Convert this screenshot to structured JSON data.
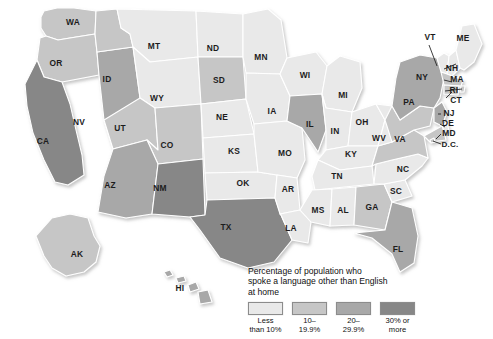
{
  "map": {
    "title": "Percentage of population who spoke a language other than English at home",
    "background_color": "#ffffff",
    "border_color": "#ffffff",
    "label_color": "#1c1c1c"
  },
  "legend": {
    "heading_line1": "Percentage of population who",
    "heading_line2": "spoke a language other than English",
    "heading_line3": "at home",
    "heading": "Percentage of population who\nspoke a language other than English\nat home",
    "items": [
      {
        "label": "Less\nthan 10%",
        "label_line1": "Less",
        "label_line2": "than 10%",
        "color": "#e9e9e9",
        "range_min": 0,
        "range_max": 10
      },
      {
        "label": "10–\n19.9%",
        "label_line1": "10–",
        "label_line2": "19.9%",
        "color": "#c6c6c6",
        "range_min": 10,
        "range_max": 19.9
      },
      {
        "label": "20–\n29.9%",
        "label_line1": "20–",
        "label_line2": "29.9%",
        "color": "#a8a8a8",
        "range_min": 20,
        "range_max": 29.9
      },
      {
        "label": "30% or\nmore",
        "label_line1": "30% or",
        "label_line2": "more",
        "color": "#878787",
        "range_min": 30,
        "range_max": 100
      }
    ]
  },
  "chart_data": {
    "type": "choropleth-map",
    "title": "Percentage of population who spoke a language other than English at home",
    "value_unit": "percent",
    "bins": [
      "Less than 10%",
      "10–19.9%",
      "20–29.9%",
      "30% or more"
    ],
    "bin_colors": [
      "#e9e9e9",
      "#c6c6c6",
      "#a8a8a8",
      "#878787"
    ],
    "categories": [
      "WA",
      "OR",
      "CA",
      "NV",
      "ID",
      "MT",
      "WY",
      "UT",
      "CO",
      "AZ",
      "NM",
      "ND",
      "SD",
      "NE",
      "KS",
      "OK",
      "TX",
      "MN",
      "IA",
      "MO",
      "AR",
      "LA",
      "WI",
      "IL",
      "MI",
      "IN",
      "OH",
      "KY",
      "TN",
      "MS",
      "AL",
      "GA",
      "FL",
      "SC",
      "NC",
      "VA",
      "WV",
      "PA",
      "NY",
      "VT",
      "NH",
      "ME",
      "MA",
      "RI",
      "CT",
      "NJ",
      "DE",
      "MD",
      "D.C.",
      "AK",
      "HI"
    ],
    "values": [
      1,
      1,
      3,
      2,
      1,
      0,
      0,
      1,
      1,
      2,
      3,
      0,
      1,
      0,
      0,
      0,
      3,
      0,
      0,
      0,
      0,
      0,
      0,
      2,
      0,
      0,
      0,
      0,
      0,
      0,
      0,
      1,
      2,
      0,
      0,
      1,
      0,
      1,
      2,
      0,
      0,
      0,
      1,
      1,
      1,
      2,
      0,
      1,
      1,
      1,
      2
    ],
    "legend_position": "bottom-right"
  },
  "states": [
    {
      "id": "WA",
      "label": "WA",
      "bin": 1,
      "label_x": 73,
      "label_y": 23
    },
    {
      "id": "OR",
      "label": "OR",
      "bin": 1,
      "label_x": 56,
      "label_y": 64
    },
    {
      "id": "CA",
      "label": "CA",
      "bin": 3,
      "label_x": 43,
      "label_y": 142
    },
    {
      "id": "NV",
      "label": "NV",
      "bin": 2,
      "label_x": 79,
      "label_y": 123
    },
    {
      "id": "ID",
      "label": "ID",
      "bin": 1,
      "label_x": 107,
      "label_y": 80
    },
    {
      "id": "MT",
      "label": "MT",
      "bin": 0,
      "label_x": 154,
      "label_y": 47
    },
    {
      "id": "WY",
      "label": "WY",
      "bin": 0,
      "label_x": 157,
      "label_y": 99
    },
    {
      "id": "UT",
      "label": "UT",
      "bin": 1,
      "label_x": 120,
      "label_y": 129
    },
    {
      "id": "CO",
      "label": "CO",
      "bin": 1,
      "label_x": 167,
      "label_y": 146
    },
    {
      "id": "AZ",
      "label": "AZ",
      "bin": 2,
      "label_x": 110,
      "label_y": 186
    },
    {
      "id": "NM",
      "label": "NM",
      "bin": 3,
      "label_x": 160,
      "label_y": 189
    },
    {
      "id": "ND",
      "label": "ND",
      "bin": 0,
      "label_x": 213,
      "label_y": 49
    },
    {
      "id": "SD",
      "label": "SD",
      "bin": 1,
      "label_x": 219,
      "label_y": 81
    },
    {
      "id": "NE",
      "label": "NE",
      "bin": 0,
      "label_x": 222,
      "label_y": 118
    },
    {
      "id": "KS",
      "label": "KS",
      "bin": 0,
      "label_x": 234,
      "label_y": 152
    },
    {
      "id": "OK",
      "label": "OK",
      "bin": 0,
      "label_x": 243,
      "label_y": 184
    },
    {
      "id": "TX",
      "label": "TX",
      "bin": 3,
      "label_x": 226,
      "label_y": 228
    },
    {
      "id": "MN",
      "label": "MN",
      "bin": 0,
      "label_x": 261,
      "label_y": 58
    },
    {
      "id": "IA",
      "label": "IA",
      "bin": 0,
      "label_x": 272,
      "label_y": 112
    },
    {
      "id": "MO",
      "label": "MO",
      "bin": 0,
      "label_x": 285,
      "label_y": 154
    },
    {
      "id": "AR",
      "label": "AR",
      "bin": 0,
      "label_x": 288,
      "label_y": 190
    },
    {
      "id": "LA",
      "label": "LA",
      "bin": 0,
      "label_x": 291,
      "label_y": 229
    },
    {
      "id": "WI",
      "label": "WI",
      "bin": 0,
      "label_x": 305,
      "label_y": 76
    },
    {
      "id": "IL",
      "label": "IL",
      "bin": 2,
      "label_x": 310,
      "label_y": 125
    },
    {
      "id": "MI",
      "label": "MI",
      "bin": 0,
      "label_x": 343,
      "label_y": 96
    },
    {
      "id": "IN",
      "label": "IN",
      "bin": 0,
      "label_x": 335,
      "label_y": 132
    },
    {
      "id": "OH",
      "label": "OH",
      "bin": 0,
      "label_x": 362,
      "label_y": 123
    },
    {
      "id": "KY",
      "label": "KY",
      "bin": 0,
      "label_x": 351,
      "label_y": 155
    },
    {
      "id": "TN",
      "label": "TN",
      "bin": 0,
      "label_x": 337,
      "label_y": 177
    },
    {
      "id": "MS",
      "label": "MS",
      "bin": 0,
      "label_x": 318,
      "label_y": 211
    },
    {
      "id": "AL",
      "label": "AL",
      "bin": 0,
      "label_x": 343,
      "label_y": 211
    },
    {
      "id": "GA",
      "label": "GA",
      "bin": 1,
      "label_x": 372,
      "label_y": 208
    },
    {
      "id": "FL",
      "label": "FL",
      "bin": 2,
      "label_x": 398,
      "label_y": 250
    },
    {
      "id": "SC",
      "label": "SC",
      "bin": 0,
      "label_x": 396,
      "label_y": 192
    },
    {
      "id": "NC",
      "label": "NC",
      "bin": 0,
      "label_x": 403,
      "label_y": 170
    },
    {
      "id": "VA",
      "label": "VA",
      "bin": 1,
      "label_x": 400,
      "label_y": 140
    },
    {
      "id": "WV",
      "label": "WV",
      "bin": 0,
      "label_x": 379,
      "label_y": 139
    },
    {
      "id": "PA",
      "label": "PA",
      "bin": 1,
      "label_x": 409,
      "label_y": 103
    },
    {
      "id": "NY",
      "label": "NY",
      "bin": 2,
      "label_x": 422,
      "label_y": 78
    },
    {
      "id": "VT",
      "label": "VT",
      "bin": 0,
      "label_x": 430,
      "label_y": 38
    },
    {
      "id": "NH",
      "label": "NH",
      "bin": 0,
      "label_x": 452,
      "label_y": 69
    },
    {
      "id": "ME",
      "label": "ME",
      "bin": 0,
      "label_x": 463,
      "label_y": 39
    },
    {
      "id": "MA",
      "label": "MA",
      "bin": 1,
      "label_x": 457,
      "label_y": 80
    },
    {
      "id": "RI",
      "label": "RI",
      "bin": 1,
      "label_x": 454,
      "label_y": 91
    },
    {
      "id": "CT",
      "label": "CT",
      "bin": 1,
      "label_x": 456,
      "label_y": 101
    },
    {
      "id": "NJ",
      "label": "NJ",
      "bin": 2,
      "label_x": 449,
      "label_y": 114
    },
    {
      "id": "DE",
      "label": "DE",
      "bin": 0,
      "label_x": 448,
      "label_y": 124
    },
    {
      "id": "MD",
      "label": "MD",
      "bin": 1,
      "label_x": 449,
      "label_y": 134
    },
    {
      "id": "D.C.",
      "label": "D.C.",
      "bin": 1,
      "label_x": 450,
      "label_y": 145
    },
    {
      "id": "AK",
      "label": "AK",
      "bin": 1,
      "label_x": 77,
      "label_y": 255
    },
    {
      "id": "HI",
      "label": "HI",
      "bin": 2,
      "label_x": 180,
      "label_y": 289
    }
  ]
}
